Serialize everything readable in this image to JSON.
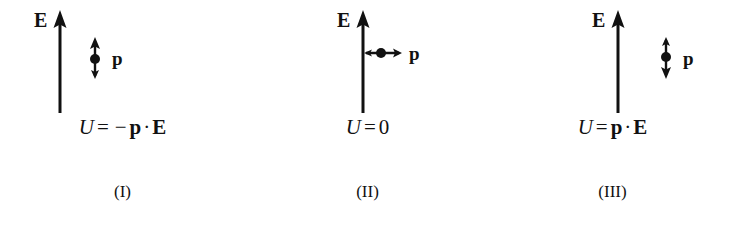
{
  "figure": {
    "background_color": "#ffffff",
    "ink_color": "#111111",
    "panel_count": 3
  },
  "panels": [
    {
      "id": "I",
      "caption": "(I)",
      "field": {
        "label": "E",
        "direction": "up",
        "icon": "up-arrow-icon"
      },
      "dipole": {
        "label": "p",
        "orientation": "up",
        "icon": "dipole-arrow-up-icon",
        "description": "dipole parallel to field"
      },
      "formula": {
        "lhs": "U",
        "equals": "=",
        "sign": "−",
        "vector_1": "p",
        "dot": "·",
        "vector_2": "E",
        "value": "",
        "plain": "U = −p · E"
      }
    },
    {
      "id": "II",
      "caption": "(II)",
      "field": {
        "label": "E",
        "direction": "up",
        "icon": "up-arrow-icon"
      },
      "dipole": {
        "label": "p",
        "orientation": "right",
        "icon": "dipole-arrow-right-icon",
        "description": "dipole perpendicular to field"
      },
      "formula": {
        "lhs": "U",
        "equals": "=",
        "sign": "",
        "vector_1": "",
        "dot": "",
        "vector_2": "",
        "value": "0",
        "plain": "U = 0"
      }
    },
    {
      "id": "III",
      "caption": "(III)",
      "field": {
        "label": "E",
        "direction": "up",
        "icon": "up-arrow-icon"
      },
      "dipole": {
        "label": "p",
        "orientation": "down",
        "icon": "dipole-arrow-down-icon",
        "description": "dipole antiparallel to field"
      },
      "formula": {
        "lhs": "U",
        "equals": "=",
        "sign": "",
        "vector_1": "p",
        "dot": "·",
        "vector_2": "E",
        "value": "",
        "plain": "U = p · E"
      }
    }
  ]
}
